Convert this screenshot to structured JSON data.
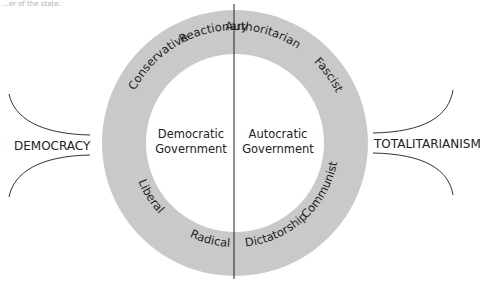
{
  "header": {
    "cutoff_text": "...er of the state."
  },
  "diagram": {
    "ring_color": "#c9c9c9",
    "left_pole": "DEMOCRACY",
    "right_pole": "TOTALITARIANISM",
    "center_left": {
      "line1": "Democratic",
      "line2": "Government"
    },
    "center_right": {
      "line1": "Autocratic",
      "line2": "Government"
    },
    "ring_labels": {
      "conservative": "Conservative",
      "reactionary": "Reactionary",
      "authoritarian": "Authoritarian",
      "fascist": "Fascist",
      "communist": "Communist",
      "dictatorship": "Dictatorship",
      "radical": "Radical",
      "liberal": "Liberal"
    }
  }
}
